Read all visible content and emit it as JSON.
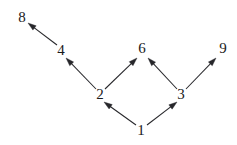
{
  "figure": {
    "kind": "directed-graph",
    "background_color": "#ffffff",
    "line_color": "#27272b",
    "label_color": "#1a1a1a",
    "width": 237,
    "height": 145
  },
  "nodes": [
    {
      "id": "1",
      "label": "1",
      "x": 141,
      "y": 131
    },
    {
      "id": "2",
      "label": "2",
      "x": 100,
      "y": 95
    },
    {
      "id": "3",
      "label": "3",
      "x": 181,
      "y": 95
    },
    {
      "id": "4",
      "label": "4",
      "x": 61,
      "y": 51
    },
    {
      "id": "6",
      "label": "6",
      "x": 142,
      "y": 49
    },
    {
      "id": "8",
      "label": "8",
      "x": 22,
      "y": 18
    },
    {
      "id": "9",
      "label": "9",
      "x": 223,
      "y": 49
    }
  ],
  "edges": [
    {
      "from": "1",
      "to": "2",
      "x1": 136,
      "y1": 125,
      "x2": 104,
      "y2": 102,
      "label": "1 to 2"
    },
    {
      "from": "1",
      "to": "3",
      "x1": 147,
      "y1": 125,
      "x2": 177,
      "y2": 102,
      "label": "1 to 3"
    },
    {
      "from": "2",
      "to": "4",
      "x1": 96,
      "y1": 89,
      "x2": 66,
      "y2": 58,
      "label": "2 to 4"
    },
    {
      "from": "2",
      "to": "6",
      "x1": 105,
      "y1": 89,
      "x2": 137,
      "y2": 58,
      "label": "2 to 6"
    },
    {
      "from": "3",
      "to": "6",
      "x1": 177,
      "y1": 89,
      "x2": 148,
      "y2": 58,
      "label": "3 to 6"
    },
    {
      "from": "3",
      "to": "9",
      "x1": 186,
      "y1": 89,
      "x2": 216,
      "y2": 58,
      "label": "3 to 9"
    },
    {
      "from": "4",
      "to": "8",
      "x1": 57,
      "y1": 45,
      "x2": 28,
      "y2": 23,
      "label": "4 to 8"
    }
  ]
}
